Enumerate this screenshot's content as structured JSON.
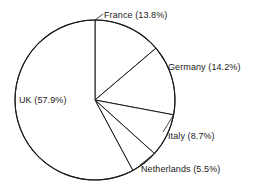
{
  "chart_data": {
    "type": "pie",
    "title": "",
    "categories": [
      "France",
      "Germany",
      "Italy",
      "Netherlands",
      "UK"
    ],
    "values": [
      13.8,
      14.2,
      8.7,
      5.5,
      57.9
    ],
    "value_unit": "%",
    "labels": [
      "France (13.8%)",
      "Germany (14.2%)",
      "Italy (8.7%)",
      "Netherlands (5.5%)",
      "UK (57.9%)"
    ],
    "start_angle_deg": 0,
    "direction": "clockwise",
    "legend": "none",
    "grid": false,
    "slice_fill": "#ffffff",
    "slice_stroke": "#1a1a1a",
    "background": "#ffffff"
  },
  "labels": {
    "france": "France (13.8%)",
    "germany": "Germany (14.2%)",
    "italy": "Italy (8.7%)",
    "netherlands": "Netherlands (5.5%)",
    "uk": "UK (57.9%)"
  }
}
